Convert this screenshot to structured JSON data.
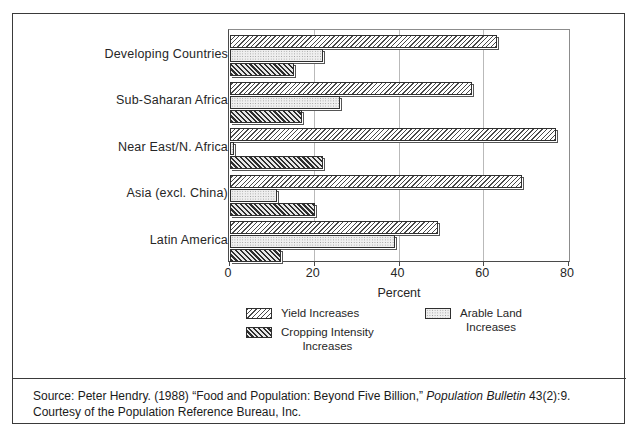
{
  "chart_data": {
    "type": "bar",
    "orientation": "horizontal",
    "title": "",
    "xlabel": "Percent",
    "ylabel": "",
    "xlim": [
      0,
      80
    ],
    "xticks": [
      0,
      20,
      40,
      60,
      80
    ],
    "grid": true,
    "legend_position": "below-plot",
    "categories": [
      "Developing Countries",
      "Sub-Saharan Africa",
      "Near East/N. Africa",
      "Asia (excl. China)",
      "Latin America"
    ],
    "series": [
      {
        "name": "Yield Increases",
        "pattern": "diagonal-hatch-light",
        "values": [
          63,
          57,
          77,
          69,
          49
        ]
      },
      {
        "name": "Arable Land Increases",
        "pattern": "stipple-light",
        "values": [
          22,
          26,
          1,
          11,
          39
        ]
      },
      {
        "name": "Cropping Intensity Increases",
        "pattern": "diagonal-hatch-dark",
        "values": [
          15,
          17,
          22,
          20,
          12
        ]
      }
    ]
  },
  "axis": {
    "x_title": "Percent",
    "tick_labels": [
      "0",
      "20",
      "40",
      "60",
      "80"
    ]
  },
  "legend": {
    "entries": [
      {
        "label": "Yield Increases",
        "pattern": "diagonal-hatch-light"
      },
      {
        "label": "Cropping Intensity\nIncreases",
        "pattern": "diagonal-hatch-dark"
      },
      {
        "label": "Arable Land\nIncreases",
        "pattern": "stipple-light"
      }
    ]
  },
  "source": {
    "line1_prefix": "Source: Peter Hendry. (1988) “Food and Population: Beyond Five Billion,” ",
    "line1_italic": "Population Bulletin",
    "line1_suffix": " 43(2):9.",
    "line2": "Courtesy of the Population Reference Bureau, Inc."
  },
  "colors": {
    "frame": "#3a3a3a",
    "gridline": "#b9b9b9",
    "bar_outline": "#2f2f2f",
    "text": "#262626",
    "background": "#ffffff"
  }
}
